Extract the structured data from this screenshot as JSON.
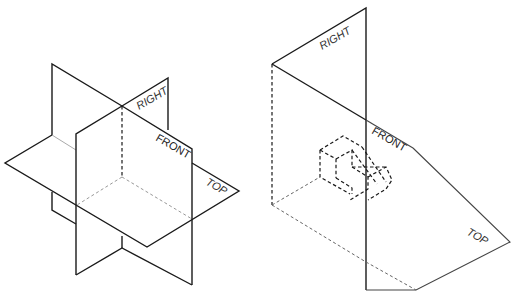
{
  "figures": [
    {
      "id": "intersecting-planes",
      "labels": {
        "right": "RIGHT",
        "front": "FRONT",
        "top": "TOP"
      }
    },
    {
      "id": "projection-planes-with-object",
      "labels": {
        "right": "RIGHT",
        "front": "FRONT",
        "top": "TOP"
      }
    }
  ],
  "colors": {
    "line": "#1a1a1a",
    "hidden_line": "#999999",
    "background": "#ffffff"
  }
}
